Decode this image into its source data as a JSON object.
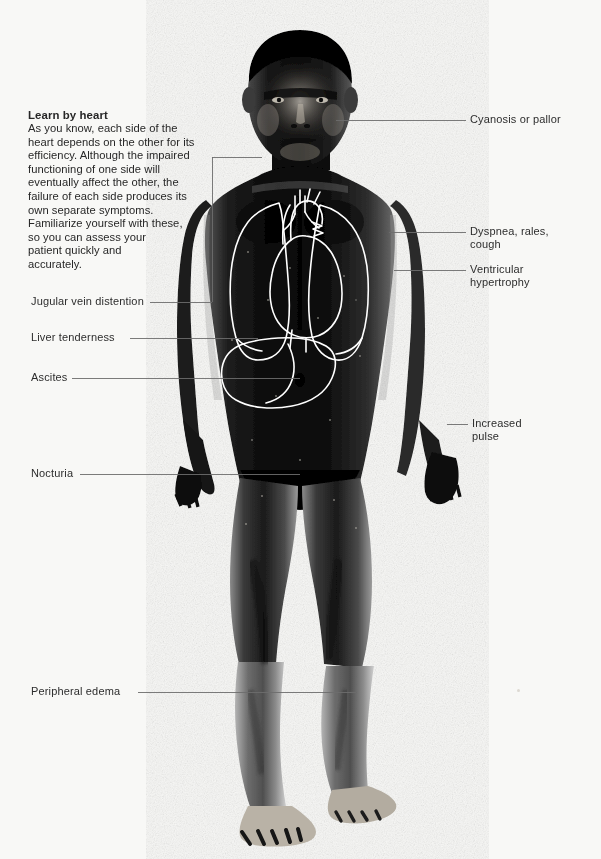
{
  "page": {
    "background_color": "#f8f8f6",
    "width": 601,
    "height": 859
  },
  "caption": {
    "title": "Learn by heart",
    "body": "As you know, each side of the\nheart depends on the other for its\nefficiency. Although the impaired\nfunctioning of one side will\neventually affect the other, the\nfailure of each side produces its\nown separate symptoms.\nFamiliarize yourself with these,\nso  you can assess your\npatient quickly and\naccurately."
  },
  "figure": {
    "alt": "Full-length high-contrast black and white photograph of a standing nude male patient, facing forward, with anatomical line overlay of lungs, heart and liver drawn on the torso.",
    "overlay_color": "#ffffff",
    "overlay_parts": [
      "right-lung",
      "left-lung",
      "heart",
      "aortic-arch",
      "pulmonary-artery",
      "liver"
    ]
  },
  "callouts": {
    "left": [
      {
        "id": "jugular-vein-distention",
        "label": "Jugular vein distention"
      },
      {
        "id": "liver-tenderness",
        "label": "Liver  tenderness"
      },
      {
        "id": "ascites",
        "label": "Ascites"
      },
      {
        "id": "nocturia",
        "label": "Nocturia"
      },
      {
        "id": "peripheral-edema",
        "label": "Peripheral edema"
      }
    ],
    "right": [
      {
        "id": "cyanosis-or-pallor",
        "label": "Cyanosis or pallor"
      },
      {
        "id": "dyspnea-rales-cough",
        "label": "Dyspnea, rales,\ncough"
      },
      {
        "id": "ventricular-hypertrophy",
        "label": "Ventricular\nhypertrophy"
      },
      {
        "id": "increased-pulse",
        "label": "Increased\npulse"
      }
    ]
  },
  "leader_line_color": "#6d6d6d"
}
